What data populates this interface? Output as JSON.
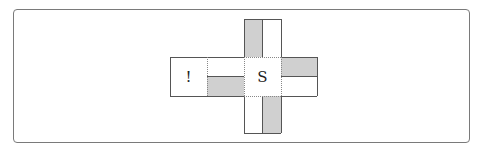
{
  "diagram": {
    "cells": {
      "left": {
        "label": "!"
      },
      "center": {
        "label": "S"
      }
    },
    "colors": {
      "shade": "#d0d0d0",
      "border": "#555555",
      "frame": "#7a7a7a"
    }
  }
}
